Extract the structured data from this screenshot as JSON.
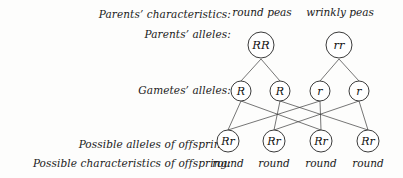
{
  "diagram": {
    "stroke_color": "#3b3b3b",
    "background_color": "#fdfdfc",
    "text_color": "#1a1a1a"
  },
  "row_labels": {
    "parents_characteristics": "Parents’ characteristics:",
    "parents_alleles": "Parents’ alleles:",
    "gametes_alleles": "Gametes’ alleles:",
    "offspring_alleles": "Possible alleles of offspring:",
    "offspring_characteristics": "Possible characteristics of offspring:"
  },
  "parents": {
    "characteristics": [
      {
        "text": "round peas",
        "x": 262
      },
      {
        "text": "wrinkly peas",
        "x": 340
      }
    ],
    "alleles": [
      {
        "text": "RR",
        "x": 261,
        "y": 45
      },
      {
        "text": "rr",
        "x": 339,
        "y": 45
      }
    ]
  },
  "gametes": {
    "alleles": [
      {
        "text": "R",
        "x": 241,
        "y": 91
      },
      {
        "text": "R",
        "x": 280,
        "y": 91
      },
      {
        "text": "r",
        "x": 320,
        "y": 91
      },
      {
        "text": "r",
        "x": 359,
        "y": 91
      }
    ]
  },
  "offspring": {
    "alleles": [
      {
        "text": "Rr",
        "x": 228,
        "y": 141
      },
      {
        "text": "Rr",
        "x": 274,
        "y": 141
      },
      {
        "text": "Rr",
        "x": 321,
        "y": 141
      },
      {
        "text": "Rr",
        "x": 368,
        "y": 141
      }
    ],
    "characteristics": [
      {
        "text": "round",
        "x": 228
      },
      {
        "text": "round",
        "x": 274
      },
      {
        "text": "round",
        "x": 321
      },
      {
        "text": "round",
        "x": 368
      }
    ]
  },
  "connections": {
    "parent_to_gamete": [
      {
        "x1": 261,
        "y1": 59,
        "x2": 241,
        "y2": 81
      },
      {
        "x1": 261,
        "y1": 59,
        "x2": 280,
        "y2": 81
      },
      {
        "x1": 339,
        "y1": 59,
        "x2": 320,
        "y2": 81
      },
      {
        "x1": 339,
        "y1": 59,
        "x2": 359,
        "y2": 81
      }
    ],
    "gamete_to_offspring": [
      {
        "from": "R1",
        "to": "Rr1",
        "x1": 241,
        "y1": 101,
        "x2": 228,
        "y2": 130
      },
      {
        "from": "R1",
        "to": "Rr3",
        "x1": 241,
        "y1": 101,
        "x2": 321,
        "y2": 130
      },
      {
        "from": "R2",
        "to": "Rr2",
        "x1": 280,
        "y1": 101,
        "x2": 274,
        "y2": 130
      },
      {
        "from": "R2",
        "to": "Rr4",
        "x1": 280,
        "y1": 101,
        "x2": 368,
        "y2": 130
      },
      {
        "from": "r3",
        "to": "Rr1",
        "x1": 320,
        "y1": 101,
        "x2": 228,
        "y2": 130
      },
      {
        "from": "r3",
        "to": "Rr3",
        "x1": 320,
        "y1": 101,
        "x2": 321,
        "y2": 130
      },
      {
        "from": "r4",
        "to": "Rr2",
        "x1": 359,
        "y1": 101,
        "x2": 274,
        "y2": 130
      },
      {
        "from": "r4",
        "to": "Rr4",
        "x1": 359,
        "y1": 101,
        "x2": 368,
        "y2": 130
      }
    ]
  }
}
